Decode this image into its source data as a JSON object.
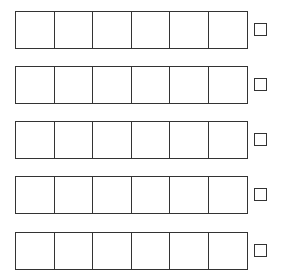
{
  "diagram": {
    "rows": [
      {
        "top": 11,
        "cells": 6
      },
      {
        "top": 66,
        "cells": 6
      },
      {
        "top": 121,
        "cells": 6
      },
      {
        "top": 176,
        "cells": 6
      },
      {
        "top": 232,
        "cells": 6
      }
    ],
    "stroke_color": "#333333",
    "background": "#ffffff"
  }
}
